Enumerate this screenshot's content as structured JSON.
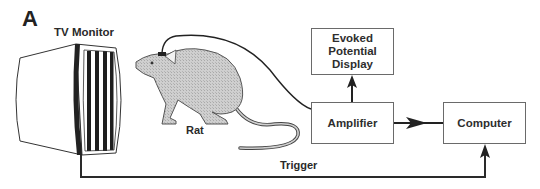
{
  "figure": {
    "panel_letter": "A",
    "labels": {
      "tv_monitor": "TV Monitor",
      "rat": "Rat",
      "trigger": "Trigger"
    },
    "boxes": {
      "evoked": {
        "lines": [
          "Evoked",
          "Potential",
          "Display"
        ]
      },
      "amplifier": {
        "label": "Amplifier"
      },
      "computer": {
        "label": "Computer"
      }
    },
    "icons": {
      "tv_monitor": "tv-monitor-icon",
      "rat": "rat-illustration",
      "electrode": "electrode-icon"
    },
    "connections": [
      {
        "from": "Rat (head electrode)",
        "to": "Amplifier",
        "style": "curved cable"
      },
      {
        "from": "Amplifier",
        "to": "Evoked Potential Display",
        "style": "arrow up"
      },
      {
        "from": "Amplifier",
        "to": "Computer",
        "style": "arrow right"
      },
      {
        "from": "TV Monitor",
        "to": "Computer",
        "label": "Trigger",
        "style": "elbow arrow"
      }
    ],
    "colors": {
      "line": "#2a2a2a",
      "rat_fill": "#c8c8c8",
      "box_border": "#6a6a6a",
      "background": "#ffffff"
    }
  }
}
